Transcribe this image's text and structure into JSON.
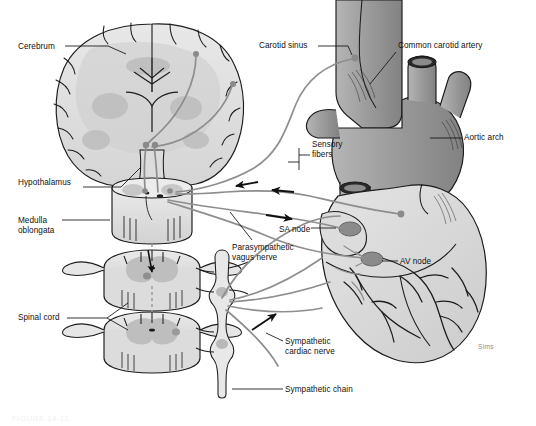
{
  "figure": {
    "artist_signature": "Sims",
    "caption": "FIGURE 14-11",
    "palette": {
      "outline": "#1b1b1b",
      "nerve": "#8e8e8e",
      "tissue_light": "#e3e3e3",
      "tissue_mid": "#c9c9c9",
      "tissue_dark": "#a8a8a8",
      "node_fill": "#8a8a8a",
      "background": "#ffffff",
      "label_text": "#111111"
    }
  },
  "labels": [
    {
      "id": "cerebrum",
      "text": "Cerebrum",
      "x": 18,
      "y": 42,
      "align": "left"
    },
    {
      "id": "hypothalamus",
      "text": "Hypothalamus",
      "x": 18,
      "y": 178,
      "align": "left"
    },
    {
      "id": "medulla-oblongata",
      "text": "Medulla\noblongata",
      "x": 18,
      "y": 216,
      "align": "left"
    },
    {
      "id": "spinal-cord",
      "text": "Spinal cord",
      "x": 18,
      "y": 313,
      "align": "left"
    },
    {
      "id": "carotid-sinus",
      "text": "Carotid sinus",
      "x": 259,
      "y": 41,
      "align": "left"
    },
    {
      "id": "common-carotid",
      "text": "Common carotid artery",
      "x": 398,
      "y": 41,
      "align": "left"
    },
    {
      "id": "aortic-arch",
      "text": "Aortic arch",
      "x": 464,
      "y": 133,
      "align": "left"
    },
    {
      "id": "sensory-fibers",
      "text": "Sensory\nfibers",
      "x": 312,
      "y": 140,
      "align": "left"
    },
    {
      "id": "sa-node",
      "text": "SA node",
      "x": 279,
      "y": 225,
      "align": "left"
    },
    {
      "id": "av-node",
      "text": "AV node",
      "x": 400,
      "y": 257,
      "align": "left"
    },
    {
      "id": "parasympathetic-vagus",
      "text": "Parasympathetic\nvagus nerve",
      "x": 232,
      "y": 243,
      "align": "left"
    },
    {
      "id": "sympathetic-cardiac",
      "text": "Sympathetic\ncardiac nerve",
      "x": 285,
      "y": 337,
      "align": "left"
    },
    {
      "id": "sympathetic-chain",
      "text": "Sympathetic chain",
      "x": 285,
      "y": 385,
      "align": "left"
    }
  ],
  "structures": [
    {
      "id": "cerebrum",
      "kind": "coronal-brain-section",
      "note": "cerebral hemispheres with gyri, sulci and lateral ventricles"
    },
    {
      "id": "hypothalamus",
      "kind": "nucleus",
      "note": "paired nuclei at base of brain"
    },
    {
      "id": "medulla-oblongata",
      "kind": "brainstem-block",
      "note": "cardiac control centers"
    },
    {
      "id": "spinal-cord-upper",
      "kind": "spinal-cord-section",
      "note": "cross section with butterfly gray matter"
    },
    {
      "id": "spinal-cord-lower",
      "kind": "spinal-cord-section",
      "note": "cross section with butterfly gray matter"
    },
    {
      "id": "common-carotid-artery",
      "kind": "vessel",
      "note": "ascending great vessel"
    },
    {
      "id": "carotid-sinus",
      "kind": "baroreceptor",
      "note": "receptor at carotid bifurcation"
    },
    {
      "id": "aortic-arch",
      "kind": "vessel",
      "note": "arch with brachiocephalic branches"
    },
    {
      "id": "heart",
      "kind": "organ",
      "note": "heart with coronary vasculature"
    },
    {
      "id": "sa-node",
      "kind": "conduction-node",
      "note": "sinoatrial node"
    },
    {
      "id": "av-node",
      "kind": "conduction-node",
      "note": "atrioventricular node"
    },
    {
      "id": "sympathetic-chain",
      "kind": "ganglion-chain",
      "note": "paravertebral sympathetic trunk"
    }
  ],
  "pathways": [
    {
      "id": "sensory-afferent-carotid",
      "direction": "toward-brain",
      "note": "carotid sinus to medulla"
    },
    {
      "id": "sensory-afferent-aortic",
      "direction": "toward-brain",
      "note": "aortic arch to medulla"
    },
    {
      "id": "parasympathetic-vagus",
      "direction": "toward-heart",
      "note": "medulla to SA and AV nodes"
    },
    {
      "id": "sympathetic-cardiac",
      "direction": "toward-heart",
      "note": "sympathetic chain to heart"
    }
  ]
}
